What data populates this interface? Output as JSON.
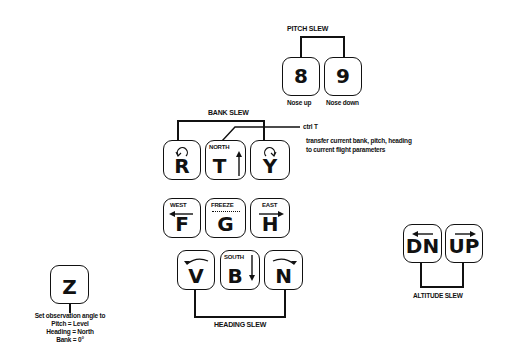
{
  "pitch_slew": {
    "label": "PITCH SLEW",
    "keys": [
      {
        "key": "8",
        "caption": "Nose up"
      },
      {
        "key": "9",
        "caption": "Nose down"
      }
    ]
  },
  "bank_slew": {
    "label": "BANK SLEW",
    "keys": [
      {
        "key": "R",
        "icon": "rotate-ccw-icon"
      },
      {
        "key": "T",
        "sublabel": "NORTH",
        "icon": "arrow-up-icon"
      },
      {
        "key": "Y",
        "icon": "rotate-cw-icon"
      }
    ],
    "ctrl_t": {
      "label": "ctrl T",
      "description_line1": "transfer current bank, pitch, heading",
      "description_line2": "to current flight parameters"
    }
  },
  "middle_row": {
    "keys": [
      {
        "key": "F",
        "sublabel": "WEST",
        "icon": "arrow-left-icon"
      },
      {
        "key": "G",
        "sublabel": "FREEZE"
      },
      {
        "key": "H",
        "sublabel": "EAST",
        "icon": "arrow-right-icon"
      }
    ]
  },
  "heading_slew": {
    "label": "HEADING SLEW",
    "keys": [
      {
        "key": "V",
        "icon": "curve-left-icon"
      },
      {
        "key": "B",
        "sublabel": "SOUTH",
        "icon": "arrow-down-icon"
      },
      {
        "key": "N",
        "icon": "curve-right-icon"
      }
    ]
  },
  "altitude_slew": {
    "label": "ALTITUDE SLEW",
    "keys": [
      {
        "key": "DN",
        "icon": "arrow-left-icon"
      },
      {
        "key": "UP",
        "icon": "arrow-right-icon"
      }
    ]
  },
  "observation": {
    "key": "Z",
    "line1": "Set observation angle to",
    "line2": "Pitch = Level",
    "line3": "Heading = North",
    "line4": "Bank = 0°"
  }
}
